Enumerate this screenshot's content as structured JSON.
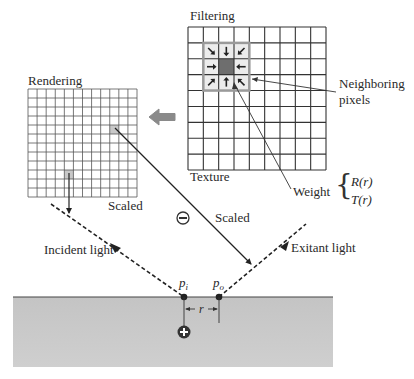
{
  "labels": {
    "filtering": "Filtering",
    "rendering": "Rendering",
    "texture": "Texture",
    "neighboring_line1": "Neighboring",
    "neighboring_line2": "pixels",
    "weight": "Weight",
    "weight_r": "R(r)",
    "weight_t": "T(r)",
    "scaled_left": "Scaled",
    "scaled_right": "Scaled",
    "incident_light": "Incident light",
    "exitant_light": "Exitant light",
    "p_i_base": "p",
    "p_i_sub": "i",
    "p_o_base": "p",
    "p_o_sub": "o",
    "r": "r"
  },
  "icons": {
    "minus": "minus-circle-icon",
    "plus": "plus-circle-icon",
    "transfer_arrow": "left-arrow-icon"
  },
  "grids": {
    "texture": {
      "cols": 9,
      "rows": 9,
      "highlight_center": [
        2,
        2
      ],
      "neighborhood": "3x3"
    },
    "rendering": {
      "cols": 12,
      "rows": 12
    }
  },
  "colors": {
    "grid_line": "#333333",
    "neighborhood_border": "#9a9a9a",
    "center_pixel": "#6e6e6e",
    "surface": "#c8c8c8",
    "transfer_arrow": "#8a8a8a"
  }
}
